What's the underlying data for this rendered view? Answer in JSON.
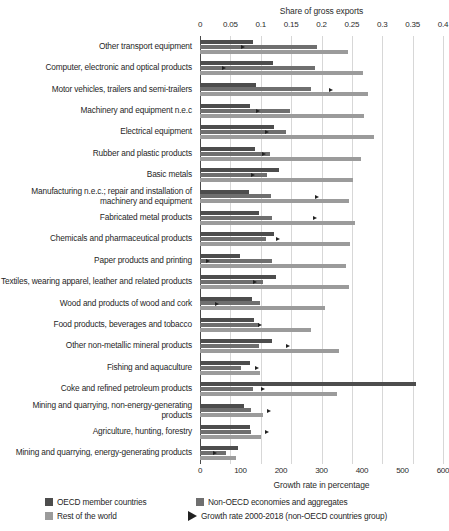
{
  "chart_data": {
    "type": "bar",
    "orientation": "horizontal",
    "title": "",
    "top_axis": {
      "label": "Share of gross exports",
      "ticks": [
        0,
        0.05,
        0.1,
        0.15,
        0.2,
        0.25,
        0.3,
        0.35,
        0.4
      ],
      "tick_labels": [
        "0",
        "0.05",
        "0.1",
        "0.15",
        "0.2",
        "0.25",
        "0.3",
        "0.35",
        "0.4"
      ],
      "range": [
        0,
        0.4
      ]
    },
    "bottom_axis": {
      "label": "Growth rate in percentage",
      "ticks": [
        0,
        100,
        200,
        300,
        400,
        500,
        600
      ],
      "tick_labels": [
        "0",
        "100",
        "200",
        "300",
        "400",
        "500",
        "600"
      ],
      "range": [
        0,
        600
      ]
    },
    "grid": true,
    "legend_position": "bottom",
    "legend": [
      {
        "key": "oecd",
        "label": "OECD member countries",
        "color": "#4d4d4d",
        "glyph": "square"
      },
      {
        "key": "non_oecd",
        "label": "Non-OECD economies and aggregates",
        "color": "#6f6f6f",
        "glyph": "square"
      },
      {
        "key": "row",
        "label": "Rest of the world",
        "color": "#9b9b9b",
        "glyph": "square"
      },
      {
        "key": "growth",
        "label": "Growth rate 2000-2018 (non-OECD countries group)",
        "color": "#222222",
        "glyph": "triangle"
      }
    ],
    "categories": [
      "Other transport equipment",
      "Computer, electronic and optical products",
      "Motor vehicles, trailers and semi-trailers",
      "Machinery and equipment n.e.c",
      "Electrical equipment",
      "Rubber and plastic products",
      "Basic metals",
      "Manufacturing n.e.c.; repair and installation of machinery and equipment",
      "Fabricated metal products",
      "Chemicals and pharmaceutical products",
      "Paper products and printing",
      "Textiles, wearing apparel, leather and related products",
      "Wood and products of wood and cork",
      "Food products, beverages and tobacco",
      "Other non-metallic mineral products",
      "Fishing and aquaculture",
      "Coke and refined petroleum products",
      "Mining and quarrying, non-energy-generating products",
      "Agriculture, hunting, forestry",
      "Mining and quarrying, energy-generating products"
    ],
    "series": [
      {
        "name": "OECD member countries",
        "key": "oecd",
        "color": "#4d4d4d",
        "unit": "share of gross exports",
        "values": [
          0.087,
          0.12,
          0.093,
          0.083,
          0.122,
          0.091,
          0.13,
          0.08,
          0.097,
          0.122,
          0.066,
          0.125,
          0.085,
          0.089,
          0.118,
          0.083,
          0.355,
          0.073,
          0.083,
          0.062
        ]
      },
      {
        "name": "Non-OECD economies and aggregates",
        "key": "non_oecd",
        "color": "#6f6f6f",
        "unit": "share of gross exports",
        "values": [
          0.192,
          0.19,
          0.182,
          0.148,
          0.142,
          0.115,
          0.11,
          0.117,
          0.119,
          0.108,
          0.118,
          0.103,
          0.098,
          0.097,
          0.097,
          0.068,
          0.087,
          0.084,
          0.084,
          0.043
        ]
      },
      {
        "name": "Rest of the world",
        "key": "row",
        "color": "#9b9b9b",
        "unit": "share of gross exports",
        "values": [
          0.243,
          0.268,
          0.277,
          0.27,
          0.287,
          0.265,
          0.252,
          0.245,
          0.255,
          0.247,
          0.24,
          0.245,
          0.205,
          0.183,
          0.228,
          0.098,
          0.226,
          0.103,
          0.1,
          0.06
        ]
      },
      {
        "name": "Growth rate 2000-2018 (non-OECD countries group)",
        "key": "growth",
        "color": "#222222",
        "unit": "percent",
        "values": [
          107,
          60,
          324,
          142,
          166,
          157,
          130,
          289,
          285,
          193,
          20,
          137,
          43,
          148,
          218,
          140,
          155,
          170,
          165,
          38
        ]
      }
    ]
  }
}
